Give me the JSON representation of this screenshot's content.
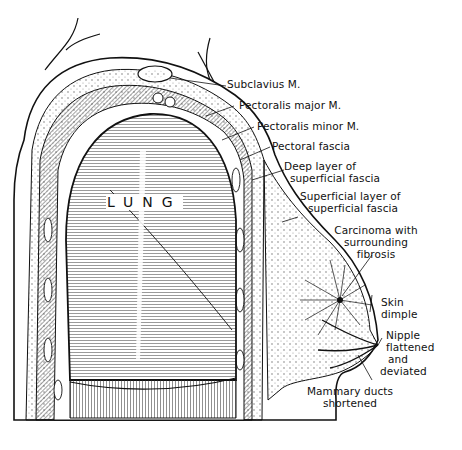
{
  "figure": {
    "organ_label": "LUNG",
    "colors": {
      "ink": "#111111",
      "paper": "#ffffff",
      "muscle_shade": "#8a8a8a",
      "lung_shade": "#bdbdbd"
    }
  },
  "labels": [
    {
      "id": "subclavius",
      "text": "Subclavius M."
    },
    {
      "id": "pectoralis-major",
      "text": "Pectoralis major M."
    },
    {
      "id": "pectoralis-minor",
      "text": "Pectoralis minor M."
    },
    {
      "id": "pectoral-fascia",
      "text": "Pectoral fascia"
    },
    {
      "id": "deep-layer",
      "lines": [
        "Deep layer of",
        "superficial fascia"
      ]
    },
    {
      "id": "superficial-layer",
      "lines": [
        "Superficial layer of",
        "superficial fascia"
      ]
    },
    {
      "id": "carcinoma",
      "lines": [
        "Carcinoma with",
        "surrounding",
        "fibrosis"
      ]
    },
    {
      "id": "skin-dimple",
      "lines": [
        "Skin",
        "dimple"
      ]
    },
    {
      "id": "nipple",
      "lines": [
        "Nipple",
        "flattened",
        "and",
        "deviated"
      ]
    },
    {
      "id": "mammary-ducts",
      "lines": [
        "Mammary ducts",
        "shortened"
      ]
    }
  ]
}
